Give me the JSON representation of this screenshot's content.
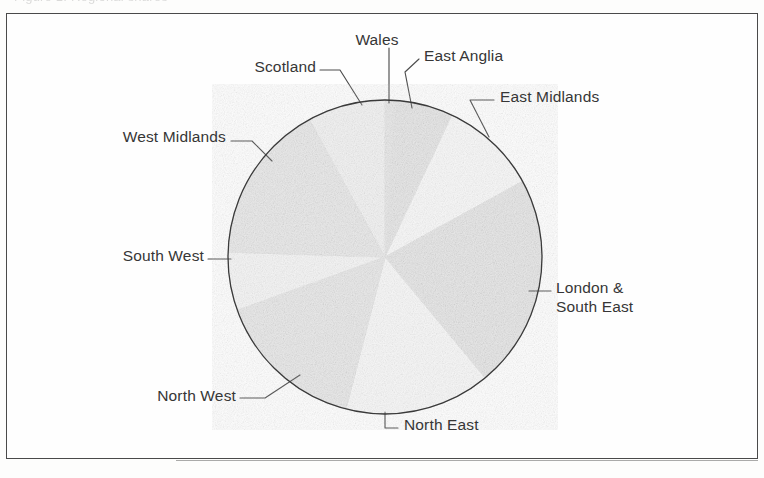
{
  "page": {
    "cropped_top_text": "Figure 1.  Regional shares",
    "background_color": "#fdfdfc",
    "frame_color": "#4a4a4a"
  },
  "chart_data": {
    "type": "pie",
    "title": "",
    "subtitle": "",
    "xlabel": "",
    "ylabel": "",
    "grid": false,
    "legend_position": "none",
    "label_style": "outside-with-leader-lines",
    "center": {
      "x": 385,
      "y": 257
    },
    "radius": 157,
    "start_angle_deg": 0,
    "direction": "clockwise",
    "categories": [
      "Wales",
      "East Anglia",
      "East Midlands",
      "London & South East",
      "North East",
      "North West",
      "South West",
      "West Midlands",
      "Scotland"
    ],
    "values": [
      1.0,
      6.0,
      10.0,
      22.0,
      15.0,
      15.5,
      6.0,
      16.5,
      8.0
    ],
    "value_unit": "percent",
    "slices": [
      {
        "label": "Wales",
        "value": 1.0,
        "start_deg": 0.0,
        "end_deg": 3.6,
        "color": "#464646"
      },
      {
        "label": "East Anglia",
        "value": 6.0,
        "start_deg": 3.6,
        "end_deg": 25.2,
        "color": "#121212"
      },
      {
        "label": "East Midlands",
        "value": 10.0,
        "start_deg": 25.2,
        "end_deg": 61.2,
        "color": "#d2d2d2"
      },
      {
        "label": "London & South East",
        "value": 22.0,
        "start_deg": 61.2,
        "end_deg": 140.4,
        "color": "#161616"
      },
      {
        "label": "North East",
        "value": 15.0,
        "start_deg": 140.4,
        "end_deg": 194.4,
        "color": "#cdcdcd"
      },
      {
        "label": "North West",
        "value": 15.5,
        "start_deg": 194.4,
        "end_deg": 250.2,
        "color": "#4b4b4b"
      },
      {
        "label": "South West",
        "value": 6.0,
        "start_deg": 250.2,
        "end_deg": 271.8,
        "color": "#bcbcbc"
      },
      {
        "label": "West Midlands",
        "value": 16.5,
        "start_deg": 271.8,
        "end_deg": 331.2,
        "color": "#535353"
      },
      {
        "label": "Scotland",
        "value": 8.0,
        "start_deg": 331.2,
        "end_deg": 360.0,
        "color": "#a8a8a8"
      }
    ]
  },
  "labels": {
    "wales": "Wales",
    "east_anglia": "East Anglia",
    "east_midlands": "East Midlands",
    "london_south_east": "London &\nSouth East",
    "north_east": "North East",
    "north_west": "North West",
    "south_west": "South West",
    "west_midlands": "West Midlands",
    "scotland": "Scotland"
  }
}
